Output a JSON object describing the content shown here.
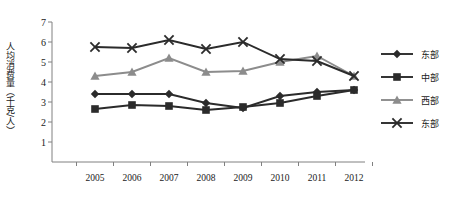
{
  "chart_data": {
    "type": "line",
    "title": "",
    "xlabel": "",
    "ylabel": "人均消费量（千克/人）",
    "categories": [
      "2005",
      "2006",
      "2007",
      "2008",
      "2009",
      "2010",
      "2011",
      "2012"
    ],
    "ylim": [
      0,
      7
    ],
    "yticks": [
      "1",
      "2",
      "3",
      "4",
      "5",
      "6",
      "7"
    ],
    "grid": false,
    "legend_position": "right",
    "series": [
      {
        "name": "东部",
        "marker": "diamond",
        "color": "#2b2b2b",
        "values": [
          3.4,
          3.4,
          3.4,
          2.95,
          2.7,
          3.3,
          3.5,
          3.6
        ]
      },
      {
        "name": "中部",
        "marker": "square",
        "color": "#2b2b2b",
        "values": [
          2.65,
          2.85,
          2.8,
          2.6,
          2.75,
          2.95,
          3.3,
          3.6
        ]
      },
      {
        "name": "西部",
        "marker": "triangle",
        "color": "#8c8c8c",
        "values": [
          4.3,
          4.5,
          5.2,
          4.5,
          4.55,
          5.0,
          5.3,
          4.3
        ]
      },
      {
        "name": "东部",
        "marker": "cross",
        "color": "#2b2b2b",
        "values": [
          5.75,
          5.7,
          6.1,
          5.65,
          6.0,
          5.15,
          5.05,
          4.3
        ]
      }
    ]
  },
  "axis": {
    "line_color": "#808080"
  }
}
